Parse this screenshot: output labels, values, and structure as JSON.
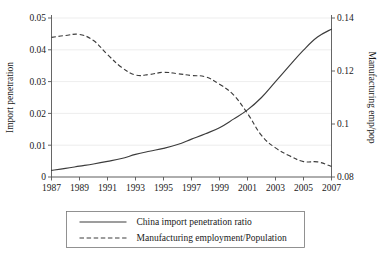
{
  "chart_data": {
    "type": "line",
    "title": "",
    "xlabel": "",
    "ylabel": "Import penetration",
    "y2label": "Manufacturing emp/pop",
    "grid": true,
    "legend_position": "bottom",
    "x": [
      1987,
      1988,
      1989,
      1990,
      1991,
      1992,
      1993,
      1994,
      1995,
      1996,
      1997,
      1998,
      1999,
      2000,
      2001,
      2002,
      2003,
      2004,
      2005,
      2006,
      2007
    ],
    "xlim": [
      1987,
      2007
    ],
    "xticks": [
      "1987",
      "1989",
      "1991",
      "1993",
      "1995",
      "1997",
      "1999",
      "2001",
      "2003",
      "2005",
      "2007"
    ],
    "xtick_values": [
      1987,
      1989,
      1991,
      1993,
      1995,
      1997,
      1999,
      2001,
      2003,
      2005,
      2007
    ],
    "ylim": [
      0,
      0.05
    ],
    "yticks": [
      "0",
      "0.01",
      "0.02",
      "0.03",
      "0.04",
      "0.05"
    ],
    "ytick_values": [
      0,
      0.01,
      0.02,
      0.03,
      0.04,
      0.05
    ],
    "y2lim": [
      0.08,
      0.14
    ],
    "y2ticks": [
      "0.08",
      "0.1",
      "0.12",
      "0.14"
    ],
    "y2tick_values": [
      0.08,
      0.1,
      0.12,
      0.14
    ],
    "series": [
      {
        "name": "China import penetration ratio",
        "axis": "left",
        "style": "solid",
        "color": "#3c3c3c",
        "values": [
          0.0021,
          0.0027,
          0.0034,
          0.0041,
          0.0049,
          0.0058,
          0.0071,
          0.0081,
          0.009,
          0.0102,
          0.0119,
          0.0136,
          0.0155,
          0.0182,
          0.0211,
          0.025,
          0.03,
          0.035,
          0.0399,
          0.044,
          0.0465
        ]
      },
      {
        "name": "Manufacturing employment/Population",
        "axis": "right",
        "style": "dashed",
        "color": "#3c3c3c",
        "values": [
          0.1327,
          0.1334,
          0.1338,
          0.1315,
          0.1262,
          0.1214,
          0.1185,
          0.1187,
          0.1195,
          0.119,
          0.1183,
          0.1178,
          0.115,
          0.111,
          0.104,
          0.0957,
          0.091,
          0.088,
          0.0858,
          0.0857,
          0.084
        ]
      }
    ]
  },
  "legend": {
    "entries": [
      {
        "label": "China import penetration ratio",
        "style": "solid"
      },
      {
        "label": "Manufacturing employment/Population",
        "style": "dashed"
      }
    ]
  }
}
